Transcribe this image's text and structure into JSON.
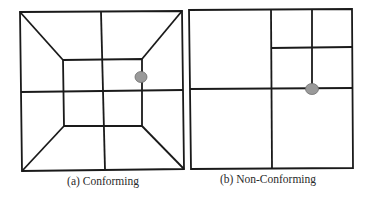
{
  "figure": {
    "panels": [
      {
        "id": "a",
        "caption": "(a) Conforming",
        "caption_pos": {
          "x": 103,
          "y": 175
        },
        "outer_square": [
          [
            20,
            12
          ],
          [
            182,
            11
          ],
          [
            184,
            169
          ],
          [
            22,
            171
          ]
        ],
        "inner_square": [
          [
            63,
            60
          ],
          [
            142,
            59
          ],
          [
            142,
            126
          ],
          [
            64,
            126
          ]
        ],
        "edges": [
          [
            [
              20,
              12
            ],
            [
              63,
              60
            ]
          ],
          [
            [
              182,
              11
            ],
            [
              142,
              59
            ]
          ],
          [
            [
              184,
              169
            ],
            [
              142,
              126
            ]
          ],
          [
            [
              22,
              171
            ],
            [
              64,
              126
            ]
          ],
          [
            [
              101,
              12
            ],
            [
              105,
              170
            ]
          ],
          [
            [
              21,
              92
            ],
            [
              183,
              90
            ]
          ]
        ],
        "hanging_node": {
          "x": 141,
          "y": 77,
          "rx": 6,
          "ry": 5.5
        }
      },
      {
        "id": "b",
        "caption": "(b) Non-Conforming",
        "caption_pos": {
          "x": 268,
          "y": 173
        },
        "outer_square": [
          [
            189,
            10
          ],
          [
            352,
            9
          ],
          [
            353,
            168
          ],
          [
            191,
            169
          ]
        ],
        "edges": [
          [
            [
              271,
              10
            ],
            [
              272,
              169
            ]
          ],
          [
            [
              190,
              89
            ],
            [
              353,
              88
            ]
          ],
          [
            [
              312,
              9
            ],
            [
              312,
              88
            ]
          ],
          [
            [
              271,
              48
            ],
            [
              352,
              47
            ]
          ]
        ],
        "hanging_node": {
          "x": 312,
          "y": 89,
          "rx": 6.5,
          "ry": 5.5
        }
      }
    ],
    "colors": {
      "line": "#1a1a1a",
      "node_fill": "#9a9a9a",
      "node_stroke": "#6e6e6e",
      "caption": "#2a2a2a"
    }
  }
}
